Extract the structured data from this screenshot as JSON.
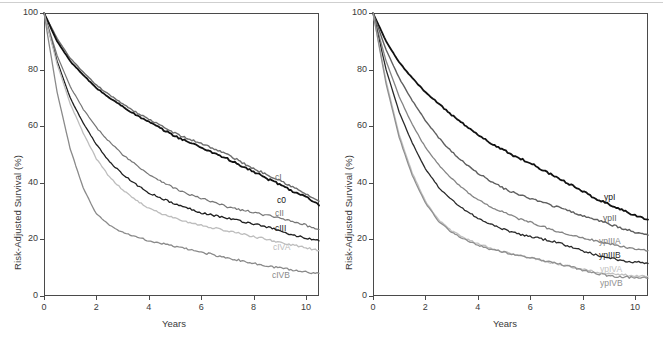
{
  "figure": {
    "title": "",
    "axis": {
      "xlabel": "Years",
      "ylabel": "Risk-Adjusted Survival (%)",
      "xticks": [
        "0",
        "2",
        "4",
        "6",
        "8",
        "10"
      ],
      "yticks": [
        "0",
        "20",
        "40",
        "60",
        "80",
        "100"
      ],
      "xlim": [
        0,
        10.5
      ],
      "ylim": [
        0,
        100
      ]
    }
  },
  "chart_data": [
    {
      "type": "line",
      "panel": "left",
      "title": "",
      "xlabel": "Years",
      "ylabel": "Risk-Adjusted Survival (%)",
      "xlim": [
        0,
        10.5
      ],
      "ylim": [
        0,
        100
      ],
      "xticks": [
        0,
        2,
        4,
        6,
        8,
        10
      ],
      "yticks": [
        0,
        20,
        40,
        60,
        80,
        100
      ],
      "grid": false,
      "legend": "inline-end-labels",
      "x": [
        0,
        0.5,
        1,
        1.5,
        2,
        2.5,
        3,
        3.5,
        4,
        4.5,
        5,
        5.5,
        6,
        6.5,
        7,
        7.5,
        8,
        8.5,
        9,
        9.5,
        10,
        10.5
      ],
      "series": [
        {
          "name": "cI",
          "label": "cI",
          "color": "#6e6e6e",
          "width": 1.4,
          "values": [
            100,
            91,
            84,
            79,
            74.5,
            71,
            68,
            65,
            62.5,
            60,
            57.5,
            55.5,
            54,
            52,
            50,
            47.5,
            45,
            43,
            41,
            38.5,
            36,
            33.5
          ]
        },
        {
          "name": "c0",
          "label": "c0",
          "color": "#111111",
          "width": 1.8,
          "values": [
            100,
            90,
            83,
            78,
            73.5,
            70,
            67,
            64,
            61.5,
            59,
            56.5,
            54.5,
            52.5,
            50.5,
            48.5,
            46,
            44,
            41.5,
            39.5,
            37,
            35,
            32
          ]
        },
        {
          "name": "cII",
          "label": "cII",
          "color": "#767676",
          "width": 1.2,
          "values": [
            100,
            85,
            74,
            66,
            59.5,
            54.5,
            50,
            46.5,
            43,
            40.5,
            38,
            36,
            34.5,
            33,
            31.5,
            30.5,
            29.5,
            28.5,
            27.5,
            26.5,
            25,
            23.5
          ]
        },
        {
          "name": "cIII",
          "label": "cIII",
          "color": "#1f1f1f",
          "width": 1.3,
          "values": [
            100,
            83,
            70,
            61,
            53.5,
            47.5,
            43,
            39.5,
            36.5,
            34.5,
            32.5,
            31,
            29.5,
            28.5,
            27.5,
            26.5,
            25.5,
            24.5,
            23,
            21.5,
            20.5,
            19.5
          ]
        },
        {
          "name": "cIVA",
          "label": "cIVA",
          "color": "#bdbdbd",
          "width": 1.3,
          "values": [
            100,
            82,
            68,
            57.5,
            48.5,
            42,
            37.5,
            34,
            31,
            29,
            27.5,
            26,
            25,
            24,
            23,
            22,
            21,
            20,
            19,
            18,
            17,
            16
          ]
        },
        {
          "name": "cIVB",
          "label": "cIVB",
          "color": "#8a8a8a",
          "width": 1.3,
          "values": [
            100,
            72,
            52,
            38,
            29,
            25,
            22.5,
            21,
            19.5,
            18.5,
            17.5,
            16.5,
            15.5,
            14.5,
            13.5,
            12.5,
            11.5,
            10.5,
            10,
            9.2,
            8.5,
            8
          ]
        }
      ]
    },
    {
      "type": "line",
      "panel": "right",
      "title": "",
      "xlabel": "Years",
      "ylabel": "Risk-Adjusted Survival (%)",
      "xlim": [
        0,
        10.5
      ],
      "ylim": [
        0,
        100
      ],
      "xticks": [
        0,
        2,
        4,
        6,
        8,
        10
      ],
      "yticks": [
        0,
        20,
        40,
        60,
        80,
        100
      ],
      "grid": false,
      "legend": "inline-end-labels",
      "x": [
        0,
        0.5,
        1,
        1.5,
        2,
        2.5,
        3,
        3.5,
        4,
        4.5,
        5,
        5.5,
        6,
        6.5,
        7,
        7.5,
        8,
        8.5,
        9,
        9.5,
        10,
        10.5
      ],
      "series": [
        {
          "name": "ypI",
          "label": "ypI",
          "color": "#111111",
          "width": 1.8,
          "values": [
            100,
            90,
            82.5,
            77,
            72,
            68,
            64,
            60.5,
            57,
            54,
            51.5,
            49,
            47,
            44.5,
            42,
            39.5,
            37,
            34.5,
            32.5,
            30.5,
            28.5,
            27
          ]
        },
        {
          "name": "ypII",
          "label": "ypII",
          "color": "#5f5f5f",
          "width": 1.4,
          "values": [
            100,
            87,
            77,
            69,
            62,
            56,
            51,
            47,
            43.5,
            40.5,
            38,
            36,
            34.5,
            33,
            31.5,
            30,
            28.5,
            27,
            25.5,
            24,
            22.5,
            21.5
          ]
        },
        {
          "name": "ypIIIA",
          "label": "ypIIIA",
          "color": "#848484",
          "width": 1.3,
          "values": [
            100,
            83,
            70.5,
            60.5,
            52.5,
            46.5,
            41.5,
            37.5,
            34,
            31.5,
            29.5,
            27.5,
            26,
            24.5,
            23,
            21.5,
            20.5,
            19.5,
            18.5,
            17.5,
            16.5,
            16
          ]
        },
        {
          "name": "ypIIIB",
          "label": "ypIIIB",
          "color": "#2a2a2a",
          "width": 1.3,
          "values": [
            100,
            80,
            65,
            54,
            45,
            38.5,
            34,
            30.5,
            27.5,
            25.5,
            23.5,
            22,
            21,
            20,
            19,
            17.5,
            16,
            14.5,
            13.5,
            12.5,
            12,
            11.5
          ]
        },
        {
          "name": "ypIVA",
          "label": "ypIVA",
          "color": "#c2c2c2",
          "width": 1.3,
          "values": [
            100,
            76,
            57,
            43.5,
            33.5,
            27,
            23,
            20.5,
            18.5,
            17,
            15.5,
            14.5,
            13.5,
            12.5,
            11.5,
            10.5,
            9.5,
            8.5,
            8,
            7.5,
            7.2,
            7
          ]
        },
        {
          "name": "ypIVB",
          "label": "ypIVB",
          "color": "#8f8f8f",
          "width": 1.3,
          "values": [
            100,
            75,
            56,
            42.5,
            33,
            26.5,
            22.5,
            20,
            18,
            16.5,
            15.5,
            14.5,
            13.5,
            12.5,
            11.5,
            10.5,
            9.2,
            8,
            7.2,
            6.8,
            6.5,
            6.3
          ]
        }
      ]
    }
  ],
  "panels": {
    "left": {
      "name": "clinical-stage-panel",
      "xlabel": "Years",
      "ylabel": "Risk-Adjusted Survival (%)",
      "xticks": [
        "0",
        "2",
        "4",
        "6",
        "8",
        "10"
      ],
      "yticks": [
        "0",
        "20",
        "40",
        "60",
        "80",
        "100"
      ],
      "curve_labels": [
        {
          "text": "cI",
          "color": "#6e6e6e",
          "x": 275,
          "y": 173
        },
        {
          "text": "c0",
          "color": "#111111",
          "x": 277,
          "y": 196
        },
        {
          "text": "cII",
          "color": "#767676",
          "x": 275,
          "y": 209
        },
        {
          "text": "cIII",
          "color": "#1f1f1f",
          "x": 275,
          "y": 224
        },
        {
          "text": "cIVA",
          "color": "#bdbdbd",
          "x": 273,
          "y": 243
        },
        {
          "text": "cIVB",
          "color": "#8a8a8a",
          "x": 272,
          "y": 271
        }
      ]
    },
    "right": {
      "name": "yp-stage-panel",
      "xlabel": "Years",
      "ylabel": "Risk-Adjusted Survival (%)",
      "xticks": [
        "0",
        "2",
        "4",
        "6",
        "8",
        "10"
      ],
      "yticks": [
        "0",
        "20",
        "40",
        "60",
        "80",
        "100"
      ],
      "curve_labels": [
        {
          "text": "ypI",
          "color": "#111111",
          "x": 604,
          "y": 193
        },
        {
          "text": "ypII",
          "color": "#5f5f5f",
          "x": 603,
          "y": 214
        },
        {
          "text": "ypIIIA",
          "color": "#848484",
          "x": 599,
          "y": 237
        },
        {
          "text": "ypIIIB",
          "color": "#2a2a2a",
          "x": 599,
          "y": 251
        },
        {
          "text": "ypIVA",
          "color": "#c2c2c2",
          "x": 600,
          "y": 265
        },
        {
          "text": "ypIVB",
          "color": "#8f8f8f",
          "x": 600,
          "y": 279
        }
      ]
    }
  }
}
